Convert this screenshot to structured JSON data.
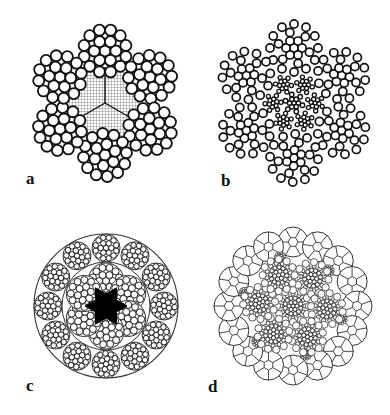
{
  "figure": {
    "colors": {
      "stroke": "#111111",
      "thin_stroke": "#333333",
      "fill": "#ffffff",
      "core_fill": "#000000",
      "fibre_hatch": "#9a9a9a"
    }
  },
  "panels": [
    {
      "id": "a",
      "label": "a",
      "label_pos": [
        26,
        170
      ],
      "type": "six-strand-fibre-core",
      "center": [
        105,
        103
      ],
      "strand_ring_radius": 52,
      "strand_radius": 27,
      "strand_count": 6,
      "strand_angle_offset": -90,
      "core": "fibre core (hatched, divided in three)",
      "wire_layers": [
        1,
        6,
        12
      ]
    },
    {
      "id": "b",
      "label": "b",
      "label_pos": [
        221,
        172
      ],
      "type": "six-strand-iwrc",
      "center": [
        294,
        103
      ],
      "strand_ring_radius": 55,
      "strand_radius": 28,
      "strand_count": 6,
      "strand_angle_offset": -90,
      "core": "independent wire rope core (steel)",
      "wire_layers": [
        1,
        6,
        6,
        12
      ]
    },
    {
      "id": "c",
      "label": "c",
      "label_pos": [
        26,
        377
      ],
      "type": "multi-layer-compacted",
      "center": [
        106,
        306
      ],
      "outer_radius": 72,
      "inner_ring_radius": 44,
      "inner_strand_radius": 19,
      "inner_strand_count": 6,
      "outer_strand_ring_radius": 58,
      "outer_strand_radius": 14,
      "outer_strand_count": 12,
      "core": "solid black star-shaped core"
    },
    {
      "id": "d",
      "label": "d",
      "label_pos": [
        208,
        378
      ],
      "type": "rotation-resistant-compacted",
      "center": [
        293,
        306
      ],
      "outer_strand_ring_radius": 64,
      "outer_strand_radius": 15,
      "outer_strand_count": 16,
      "inner_strand_ring_radius": 34,
      "inner_strand_radius": 14,
      "inner_strand_count": 6,
      "small_strand_ring_radius": 50,
      "small_strand_radius": 6,
      "small_strand_count": 6,
      "core": "central multi-wire strand"
    }
  ]
}
